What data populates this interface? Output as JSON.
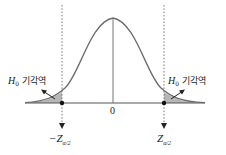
{
  "diagram": {
    "title": "",
    "type": "normal-distribution-two-tailed-test",
    "center_label": "0",
    "left_region_label": {
      "symbol": "H",
      "subscript": "0",
      "text": "기각역"
    },
    "right_region_label": {
      "symbol": "H",
      "subscript": "0",
      "text": "기각역"
    },
    "left_critical_value": {
      "prefix": "−",
      "symbol": "Z",
      "subscript": "α/2"
    },
    "right_critical_value": {
      "prefix": "",
      "symbol": "Z",
      "subscript": "α/2"
    },
    "colors": {
      "curve": "#6b6b6b",
      "axis": "#555555",
      "shade": "#a9a9a9",
      "dotted": "#777777",
      "text": "#222222"
    }
  }
}
